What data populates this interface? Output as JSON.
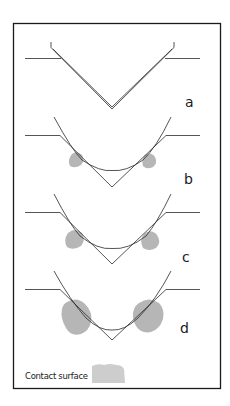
{
  "figure": {
    "panels": [
      {
        "id": "a",
        "label": "a",
        "description": "Sharp V-groove with double-line indenter profile, no contact surface"
      },
      {
        "id": "b",
        "label": "b",
        "description": "Rounded indenter in V-groove, small contact surfaces"
      },
      {
        "id": "c",
        "label": "c",
        "description": "Rounded indenter in V-groove, medium contact surfaces"
      },
      {
        "id": "d",
        "label": "d",
        "description": "Rounded indenter in V-groove, large contact surfaces"
      }
    ],
    "legend": {
      "label": "Contact surface",
      "swatch_color": "#c8c8c8"
    },
    "colors": {
      "line": "#2a2a2a",
      "frame": "#1a1a1a",
      "contact": "#a9a9a9"
    }
  }
}
